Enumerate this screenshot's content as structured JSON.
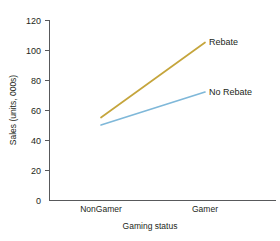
{
  "chart_data": {
    "type": "line",
    "title": "",
    "subtitle": "",
    "xlabel": "Gaming status",
    "ylabel": "Sales (units, 000s)",
    "categories": [
      "NonGamer",
      "Gamer"
    ],
    "series": [
      {
        "name": "Rebate",
        "values": [
          55,
          105
        ],
        "color": "#c5a53c"
      },
      {
        "name": "No Rebate",
        "values": [
          50,
          72
        ],
        "color": "#7fb8d9"
      }
    ],
    "ylim": [
      0,
      120
    ],
    "yticks": [
      0,
      20,
      40,
      60,
      80,
      100,
      120
    ],
    "ytick_labels": [
      "0",
      "20",
      "40",
      "60",
      "80",
      "100",
      "120"
    ],
    "grid": false,
    "legend": "inline-right-of-line-ends",
    "annotations": [
      {
        "text": "Rebate",
        "series": "Rebate",
        "position": "right-end"
      },
      {
        "text": "No Rebate",
        "series": "No Rebate",
        "position": "right-end"
      }
    ]
  },
  "axes": {
    "y_title": "Sales (units, 000s)",
    "x_title": "Gaming status",
    "y_tick_0": "0",
    "y_tick_20": "20",
    "y_tick_40": "40",
    "y_tick_60": "60",
    "y_tick_80": "80",
    "y_tick_100": "100",
    "y_tick_120": "120",
    "x_cat_1": "NonGamer",
    "x_cat_2": "Gamer"
  },
  "labels": {
    "rebate": "Rebate",
    "no_rebate": "No Rebate"
  },
  "colors": {
    "rebate_line": "#c5a53c",
    "no_rebate_line": "#7fb8d9",
    "axis": "#58595b",
    "text": "#231f20",
    "background": "#ffffff"
  }
}
